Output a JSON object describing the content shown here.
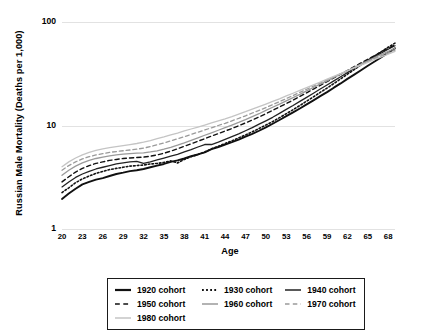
{
  "chart_data": {
    "type": "line",
    "title": "",
    "xlabel": "Age",
    "ylabel": "Russian Male Mortality (Deaths per 1,000)",
    "yscale": "log",
    "ylim": [
      1,
      100
    ],
    "yticks": [
      "1",
      "10",
      "100"
    ],
    "xlim": [
      20,
      69
    ],
    "grid": "horizontal",
    "legend_position": "bottom",
    "x": [
      20,
      21,
      22,
      23,
      24,
      25,
      26,
      27,
      28,
      29,
      30,
      31,
      32,
      33,
      34,
      35,
      36,
      37,
      38,
      39,
      40,
      41,
      42,
      43,
      44,
      45,
      46,
      47,
      48,
      49,
      50,
      51,
      52,
      53,
      54,
      55,
      56,
      57,
      58,
      59,
      60,
      61,
      62,
      63,
      64,
      65,
      66,
      67,
      68,
      69
    ],
    "xticks": [
      "20",
      "23",
      "26",
      "29",
      "32",
      "35",
      "38",
      "41",
      "44",
      "47",
      "50",
      "53",
      "56",
      "59",
      "62",
      "65",
      "68"
    ],
    "series": [
      {
        "name": "1920 cohort",
        "style": "solid",
        "color": "#111111",
        "width": 1.9,
        "values": [
          1.95,
          2.2,
          2.45,
          2.7,
          2.85,
          3.0,
          3.1,
          3.25,
          3.4,
          3.5,
          3.62,
          3.7,
          3.8,
          3.95,
          4.1,
          4.25,
          4.45,
          4.6,
          4.8,
          5.05,
          5.25,
          5.5,
          5.9,
          6.2,
          6.55,
          6.9,
          7.3,
          7.8,
          8.3,
          8.9,
          9.6,
          10.4,
          11.3,
          12.3,
          13.4,
          14.6,
          16.0,
          17.5,
          19.2,
          21.0,
          23.2,
          25.5,
          28.2,
          31.0,
          34.2,
          37.8,
          41.5,
          45.8,
          50.5,
          55.8
        ]
      },
      {
        "name": "1930 cohort",
        "style": "dotted",
        "color": "#111111",
        "width": 1.6,
        "values": [
          2.25,
          2.5,
          2.8,
          3.05,
          3.25,
          3.45,
          3.6,
          3.75,
          3.85,
          3.95,
          4.05,
          4.1,
          4.15,
          4.25,
          4.3,
          4.4,
          4.55,
          4.35,
          4.7,
          5.0,
          5.25,
          5.55,
          5.95,
          6.3,
          6.7,
          7.1,
          7.6,
          8.1,
          8.7,
          9.35,
          10.1,
          10.9,
          11.9,
          13.0,
          14.2,
          15.6,
          17.2,
          18.9,
          20.9,
          23.0,
          25.4,
          28.2,
          31.3,
          34.7,
          38.5,
          42.6,
          47.0,
          51.8,
          57.0,
          62.5
        ]
      },
      {
        "name": "1940 cohort",
        "style": "solid",
        "color": "#222222",
        "width": 1.3,
        "values": [
          2.55,
          2.85,
          3.15,
          3.4,
          3.6,
          3.8,
          3.95,
          4.1,
          4.25,
          4.35,
          4.45,
          4.5,
          4.3,
          4.45,
          4.65,
          4.85,
          5.05,
          5.25,
          5.55,
          5.85,
          6.2,
          6.55,
          6.55,
          6.9,
          7.35,
          7.8,
          8.3,
          8.9,
          9.55,
          10.3,
          11.1,
          12.0,
          13.1,
          14.3,
          15.6,
          17.1,
          18.7,
          20.5,
          22.5,
          24.6,
          27.0,
          29.6,
          32.4,
          35.5,
          38.8,
          42.3,
          46.1,
          50.2,
          54.5,
          59.0
        ]
      },
      {
        "name": "1950 cohort",
        "style": "dashed",
        "color": "#111111",
        "width": 1.4,
        "values": [
          2.85,
          3.2,
          3.55,
          3.85,
          4.1,
          4.3,
          4.45,
          4.6,
          4.7,
          4.8,
          4.85,
          4.9,
          4.95,
          5.05,
          5.2,
          5.4,
          5.65,
          5.95,
          6.3,
          6.65,
          7.05,
          7.45,
          7.9,
          8.35,
          8.85,
          9.35,
          9.95,
          10.6,
          11.3,
          12.1,
          13.0,
          14.0,
          15.1,
          16.3,
          17.6,
          19.1,
          20.7,
          22.5,
          24.4,
          26.5,
          28.8,
          31.3,
          34.0,
          37.0,
          40.2,
          43.7,
          47.4,
          51.4,
          55.7,
          60.2
        ]
      },
      {
        "name": "1960 cohort",
        "style": "solid",
        "color": "#9a9a9a",
        "width": 1.3,
        "values": [
          3.3,
          3.7,
          4.05,
          4.35,
          4.6,
          4.8,
          4.95,
          5.1,
          5.2,
          5.3,
          5.35,
          5.4,
          5.45,
          5.55,
          5.7,
          5.9,
          6.15,
          6.45,
          6.8,
          7.2,
          7.6,
          8.05,
          8.5,
          9.0,
          9.55,
          10.1,
          10.7,
          11.4,
          12.2,
          13.0,
          14.0,
          15.0,
          16.1,
          17.3,
          18.6,
          20.0,
          21.6,
          23.3,
          25.1,
          27.0,
          29.1,
          31.4,
          33.8,
          36.4,
          39.2,
          42.1,
          45.3,
          48.6,
          52.1,
          55.8
        ]
      },
      {
        "name": "1970 cohort",
        "style": "dashed",
        "color": "#9a9a9a",
        "width": 1.3,
        "values": [
          3.7,
          4.1,
          4.45,
          4.75,
          5.0,
          5.2,
          5.35,
          5.5,
          5.6,
          5.7,
          5.8,
          5.9,
          6.05,
          6.25,
          6.5,
          6.8,
          7.1,
          7.45,
          7.8,
          8.2,
          8.6,
          9.05,
          9.5,
          10.0,
          10.5,
          11.1,
          11.7,
          12.4,
          13.2,
          14.0,
          14.9,
          15.9,
          17.0,
          18.2,
          19.5,
          20.9,
          22.4,
          24.0,
          25.7,
          27.5,
          29.5,
          31.6,
          33.8,
          36.2,
          38.7,
          41.4,
          44.2,
          47.2,
          50.3,
          53.6
        ]
      },
      {
        "name": "1980 cohort",
        "style": "solid",
        "color": "#c4c4c4",
        "width": 1.3,
        "values": [
          4.0,
          4.45,
          4.85,
          5.2,
          5.5,
          5.75,
          5.95,
          6.1,
          6.25,
          6.4,
          6.55,
          6.7,
          6.9,
          7.15,
          7.45,
          7.75,
          8.1,
          8.45,
          8.85,
          9.25,
          9.65,
          10.1,
          10.6,
          11.1,
          11.6,
          12.2,
          12.9,
          13.6,
          14.4,
          15.2,
          16.1,
          17.1,
          18.1,
          19.3,
          20.5,
          21.8,
          23.2,
          24.7,
          26.3,
          28.0,
          29.8,
          31.7,
          33.8,
          36.0,
          38.3,
          40.8,
          43.4,
          46.1,
          49.0,
          52.0
        ]
      }
    ]
  },
  "legend": {
    "rows": [
      [
        {
          "label": "1920 cohort",
          "style": "solid",
          "color": "#111111",
          "width": 2.2
        },
        {
          "label": "1930 cohort",
          "style": "dotted",
          "color": "#111111",
          "width": 1.8
        },
        {
          "label": "1940 cohort",
          "style": "solid",
          "color": "#222222",
          "width": 1.5
        }
      ],
      [
        {
          "label": "1950 cohort",
          "style": "dashed",
          "color": "#111111",
          "width": 1.6
        },
        {
          "label": "1960 cohort",
          "style": "solid",
          "color": "#9a9a9a",
          "width": 1.5
        },
        {
          "label": "1970 cohort",
          "style": "dashed",
          "color": "#9a9a9a",
          "width": 1.5
        }
      ],
      [
        {
          "label": "1980 cohort",
          "style": "solid",
          "color": "#c4c4c4",
          "width": 1.5
        }
      ]
    ]
  }
}
